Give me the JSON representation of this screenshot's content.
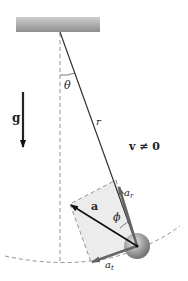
{
  "figure": {
    "labels": {
      "gravity": "g",
      "angle_theta": "θ",
      "length": "r",
      "velocity": "v ≠ 0",
      "acceleration": "a",
      "angle_phi": "ϕ",
      "radial_accel_base": "a",
      "radial_accel_sub": "r",
      "tangential_accel_base": "a",
      "tangential_accel_sub": "t"
    },
    "colors": {
      "ceiling": "#9a9a9a",
      "rod": "#333333",
      "bob": "#8a8a8a",
      "component_arrow": "#666666",
      "acceleration_arrow": "#111111",
      "parallelogram_fill": "#ececec",
      "dashed": "#777777"
    }
  }
}
